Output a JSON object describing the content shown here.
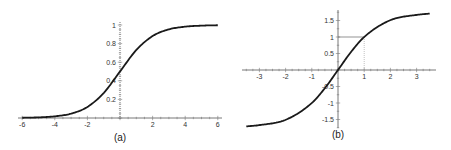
{
  "chart_data": [
    {
      "id": "a",
      "type": "line",
      "title": "",
      "caption": "(a)",
      "xlabel": "",
      "ylabel": "",
      "function": "logistic sigmoid 1/(1+e^-x)",
      "xlim": [
        -6,
        6
      ],
      "ylim": [
        0,
        1
      ],
      "x_ticks": [
        "-6",
        "-4",
        "-2",
        "2",
        "4",
        "6"
      ],
      "y_ticks": [
        "0.2",
        "0.4",
        "0.6",
        "0.8",
        "1"
      ],
      "grid": false,
      "series": [
        {
          "name": "sigmoid",
          "x": [
            -6,
            -5,
            -4,
            -3,
            -2,
            -1,
            0,
            1,
            2,
            3,
            4,
            5,
            6
          ],
          "values": [
            0.0025,
            0.0067,
            0.018,
            0.047,
            0.119,
            0.269,
            0.5,
            0.731,
            0.881,
            0.953,
            0.982,
            0.993,
            0.9975
          ]
        }
      ]
    },
    {
      "id": "b",
      "type": "line",
      "title": "",
      "caption": "(b)",
      "xlabel": "",
      "ylabel": "",
      "function": "odd saturating curve through (0,0) and (1,1), asymptote ≈ ±1.75",
      "xlim": [
        -3.5,
        3.5
      ],
      "ylim": [
        -1.75,
        1.75
      ],
      "x_ticks": [
        "-3",
        "-2",
        "-1",
        "1",
        "2",
        "3"
      ],
      "y_ticks": [
        "1.5",
        "1",
        "0.5",
        "-0.5",
        "-1",
        "-1.5"
      ],
      "grid": false,
      "annotations": [
        {
          "type": "reference-lines",
          "point": [
            1,
            1
          ],
          "description": "horizontal line from y-axis to (1,1) and dotted vertical line from (1,1) down to x-axis"
        }
      ],
      "series": [
        {
          "name": "curve",
          "x": [
            -3.5,
            -3,
            -2,
            -1,
            -0.5,
            0,
            0.5,
            1,
            2,
            3,
            3.5
          ],
          "values": [
            -1.71,
            -1.67,
            -1.51,
            -1.0,
            -0.55,
            0,
            0.55,
            1.0,
            1.51,
            1.67,
            1.71
          ]
        }
      ]
    }
  ]
}
